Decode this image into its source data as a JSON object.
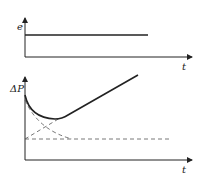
{
  "diagram": {
    "top_chart": {
      "y_label": "e",
      "x_label": "t",
      "description": "Constant step signal e(t)"
    },
    "bottom_chart": {
      "y_label": "ΔP",
      "x_label": "t",
      "description": "Response ΔP(t) = decaying component + rising ramp component; dashed lines show individual components and baseline"
    },
    "colors": {
      "line": "#222222",
      "dashed": "#555555",
      "background": "#ffffff"
    }
  }
}
